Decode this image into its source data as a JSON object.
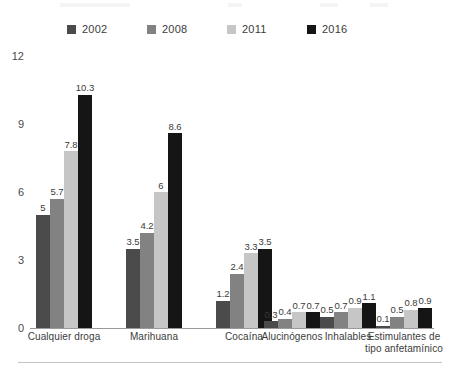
{
  "chart_data": {
    "type": "bar",
    "title": "",
    "subtitle": "",
    "xlabel": "",
    "ylabel": "",
    "ylim": [
      0,
      12
    ],
    "yticks": [
      0,
      3,
      6,
      9,
      12
    ],
    "grid": false,
    "legend_position": "top-center",
    "categories": [
      "Cualquier droga",
      "Marihuana",
      "Cocaína",
      "Alucinógenos",
      "Inhalables",
      "Estimulantes de tipo anfetamínico"
    ],
    "series": [
      {
        "name": "2002",
        "color": "#4b4b4b",
        "values": [
          5,
          3.5,
          1.2,
          0.3,
          0.5,
          0.1
        ]
      },
      {
        "name": "2008",
        "color": "#828282",
        "values": [
          5.7,
          4.2,
          2.4,
          0.4,
          0.7,
          0.5
        ]
      },
      {
        "name": "2011",
        "color": "#c6c6c6",
        "values": [
          7.8,
          6,
          3.3,
          0.7,
          0.9,
          0.8
        ]
      },
      {
        "name": "2016",
        "color": "#151515",
        "values": [
          10.3,
          8.6,
          3.5,
          0.7,
          1.1,
          0.9
        ]
      }
    ],
    "value_labels": [
      [
        "5",
        "5.7",
        "7.8",
        "10.3"
      ],
      [
        "3.5",
        "4.2",
        "6",
        "8.6"
      ],
      [
        "1.2",
        "2.4",
        "3.3",
        "3.5"
      ],
      [
        "0.3",
        "0.4",
        "0.7",
        "0.7"
      ],
      [
        "0.5",
        "0.7",
        "0.9",
        "1.1"
      ],
      [
        "0.1",
        "0.5",
        "0.8",
        "0.9"
      ]
    ],
    "category_label_lines": [
      [
        "Cualquier droga"
      ],
      [
        "Marihuana"
      ],
      [
        "Cocaína"
      ],
      [
        "Alucinógenos"
      ],
      [
        "Inhalables"
      ],
      [
        "Estimulantes de",
        "tipo anfetamínico"
      ]
    ]
  },
  "legend": {
    "items": [
      {
        "label": "2002",
        "color": "#4b4b4b"
      },
      {
        "label": "2008",
        "color": "#828282"
      },
      {
        "label": "2011",
        "color": "#c6c6c6"
      },
      {
        "label": "2016",
        "color": "#151515"
      }
    ]
  },
  "axis": {
    "y_tick_labels": [
      "12",
      "9",
      "6",
      "3",
      "0"
    ]
  }
}
